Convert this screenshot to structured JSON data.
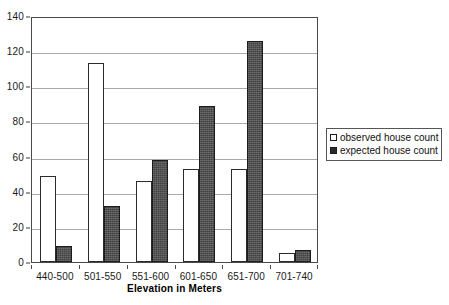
{
  "chart_data": {
    "type": "bar",
    "title": "",
    "xlabel": "Elevation in Meters",
    "ylabel": "",
    "categories": [
      "440-500",
      "501-550",
      "551-600",
      "601-650",
      "651-700",
      "701-740"
    ],
    "series": [
      {
        "name": "observed house count",
        "values": [
          49,
          113,
          46,
          53,
          53,
          5
        ]
      },
      {
        "name": "expected house count",
        "values": [
          9,
          32,
          58,
          89,
          126,
          7
        ]
      }
    ],
    "ylim": [
      0,
      140
    ],
    "ytick_values": [
      0,
      20,
      40,
      60,
      80,
      100,
      120,
      140
    ],
    "ytick_labels": [
      "0",
      "20",
      "40",
      "60",
      "80",
      "100",
      "120",
      "140"
    ],
    "grid": "horizontal",
    "legend_position": "right"
  },
  "legend": {
    "items": [
      {
        "label": "observed house count",
        "swatch": "hollow-square-icon"
      },
      {
        "label": "expected house count",
        "swatch": "filled-square-icon"
      }
    ]
  }
}
